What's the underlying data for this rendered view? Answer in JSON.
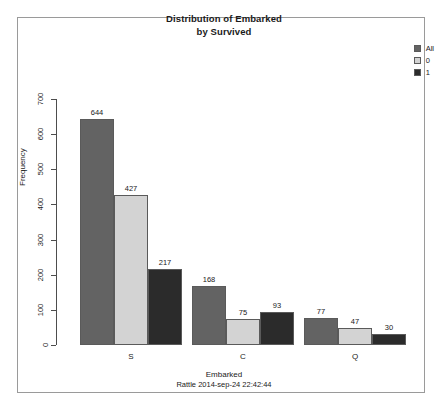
{
  "chart_data": {
    "type": "bar",
    "title": "Distribution of Embarked\nby Survived",
    "title_line1": "Distribution of Embarked",
    "title_line2": "by Survived",
    "xlabel": "Embarked",
    "ylabel": "Frequency",
    "categories": [
      "S",
      "C",
      "Q"
    ],
    "ylim": [
      0,
      700
    ],
    "yticks": [
      0,
      100,
      200,
      300,
      400,
      500,
      600,
      700
    ],
    "ytick_labels": [
      "0",
      "100",
      "200",
      "300",
      "400",
      "500",
      "600",
      "700"
    ],
    "grid": false,
    "legend_position": "top-right",
    "series": [
      {
        "name": "All",
        "color": "#636363",
        "values": [
          644,
          168,
          77
        ]
      },
      {
        "name": "0",
        "color": "#d3d3d3",
        "values": [
          427,
          75,
          47
        ]
      },
      {
        "name": "1",
        "color": "#2b2b2b",
        "values": [
          217,
          93,
          30
        ]
      }
    ],
    "annotation": "Rattle 2014-sep-24 22:42:44"
  },
  "legend": {
    "items": [
      {
        "label": "All",
        "color": "#636363"
      },
      {
        "label": "0",
        "color": "#d3d3d3"
      },
      {
        "label": "1",
        "color": "#2b2b2b"
      }
    ]
  },
  "footer": {
    "axis_title": "Embarked",
    "stamp": "Rattle 2014-sep-24 22:42:44"
  },
  "colors": {
    "frame": "#9a9a9a",
    "axis": "#4d4d4d",
    "text": "#1a1a1a",
    "background": "#ffffff",
    "bar_border": "#5a5a5a"
  }
}
